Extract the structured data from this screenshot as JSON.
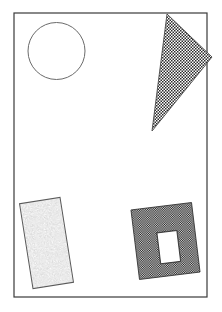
{
  "figure": {
    "canvas": {
      "width": 222,
      "height": 312,
      "background_color": "#ffffff"
    },
    "frame": {
      "name": "outer-border",
      "x": 14,
      "y": 13,
      "width": 193,
      "height": 284,
      "stroke_color": "#3a3a3a",
      "stroke_width": 1.2,
      "fill": "none"
    },
    "shapes": [
      {
        "id": "circle",
        "label": "Circle",
        "type": "circle",
        "fill_style": "none",
        "fill_color": "#ffffff",
        "stroke_color": "#6b6b6b",
        "stroke_width": 1,
        "cx": 56.5,
        "cy": 51,
        "r": 28.5
      },
      {
        "id": "triangle",
        "label": "Checkered triangle",
        "type": "triangle",
        "fill_style": "checker-light",
        "fill_color": "#2b2b2b",
        "stroke_color": "#4a4a4a",
        "stroke_width": 0.9,
        "points": "167,14 212,57 152,131"
      },
      {
        "id": "speckled-rectangle",
        "label": "Speckled rectangle",
        "type": "rectangle",
        "fill_style": "speckle",
        "fill_color": "#7d7d7d",
        "stroke_color": "#5a5a5a",
        "stroke_width": 1,
        "x": 26,
        "y": 200,
        "width": 41,
        "height": 86,
        "rotation_deg": -9
      },
      {
        "id": "dark-rectangle-with-hole",
        "label": "Dark rectangle with rectangular hole",
        "type": "rectangle-with-hole",
        "fill_style": "checker-dark",
        "fill_color": "#303030",
        "stroke_color": "#2a2a2a",
        "stroke_width": 0.8,
        "x": 135,
        "y": 206,
        "width": 61,
        "height": 70,
        "rotation_deg": -7,
        "hole": {
          "x": 158,
          "y": 232,
          "width": 20,
          "height": 31,
          "fill_color": "#ffffff"
        }
      }
    ]
  }
}
